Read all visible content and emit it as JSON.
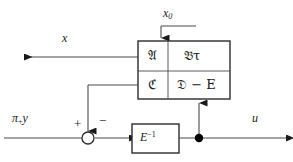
{
  "diagram": {
    "colors": {
      "line": "#4a4a4a",
      "line_dark": "#1a1a1a",
      "box_border": "#2b2b2b",
      "fill_white": "#ffffff",
      "node_fill": "#000000",
      "background": "#ffffff"
    },
    "labels": {
      "x0": "x",
      "x0_sub": "0",
      "x_out": "x",
      "pi_y": "π",
      "pi_y_sub": "+",
      "pi_y_tail": "y",
      "plus_sign": "+",
      "minus_sign": "−",
      "u_out": "u"
    },
    "matrix_box": {
      "name": "system-matrix",
      "rows": 2,
      "cols": 2,
      "cells": [
        {
          "id": "A",
          "text": "𝔄",
          "row": 0,
          "col": 0
        },
        {
          "id": "Btau",
          "text": "𝔅τ",
          "row": 0,
          "col": 1
        },
        {
          "id": "C",
          "text": "ℭ",
          "row": 1,
          "col": 0
        },
        {
          "id": "DE",
          "text": "𝔇 − E",
          "row": 1,
          "col": 1
        }
      ]
    },
    "gain_block": {
      "name": "inverse-E-block",
      "base": "E",
      "exponent": "−1",
      "display": "E⁻¹"
    },
    "nodes": {
      "summing_junction": {
        "name": "summing-junction",
        "style": "hollow-circle",
        "inputs": [
          "+",
          "−"
        ]
      },
      "branch_point": {
        "name": "branch-point",
        "style": "filled-dot"
      }
    },
    "signals": [
      {
        "name": "x0-input",
        "from": "top",
        "to": "matrix-box-top",
        "arrow": "down"
      },
      {
        "name": "x-output",
        "from": "matrix-box-left",
        "to": "left-edge",
        "arrow": "left"
      },
      {
        "name": "c-feedback",
        "from": "matrix-box-left",
        "to": "summing-junction",
        "arrow": "down"
      },
      {
        "name": "pi-y-input",
        "from": "left-edge",
        "to": "summing-junction",
        "arrow": "right"
      },
      {
        "name": "junction-to-gain",
        "from": "summing-junction",
        "to": "inverse-E-block",
        "arrow": "right"
      },
      {
        "name": "u-output",
        "from": "inverse-E-block",
        "to": "right-edge",
        "arrow": "right"
      },
      {
        "name": "u-feedback",
        "from": "branch-point",
        "to": "matrix-box-bottom",
        "arrow": "up"
      }
    ]
  }
}
